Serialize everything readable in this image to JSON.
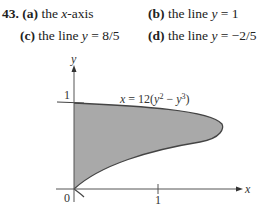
{
  "problem": {
    "number": "43.",
    "parts": [
      {
        "label": "(a)",
        "pre": "the ",
        "var": "x",
        "post": "-axis"
      },
      {
        "label": "(b)",
        "pre": "the line  ",
        "var": "y",
        "post": " = 1"
      },
      {
        "label": "(c)",
        "pre": "the line  ",
        "var": "y",
        "post": " = 8/5"
      },
      {
        "label": "(d)",
        "pre": "the line  ",
        "var": "y",
        "post": " = −2/5"
      }
    ]
  },
  "figure": {
    "equation": "x = 12(y² − y³)",
    "x_axis_label": "x",
    "y_axis_label": "y",
    "origin_label": "0",
    "x_tick_label": "1",
    "y_tick_label": "1",
    "fill_color": "#a9a9a9",
    "curve_color": "#444444"
  }
}
